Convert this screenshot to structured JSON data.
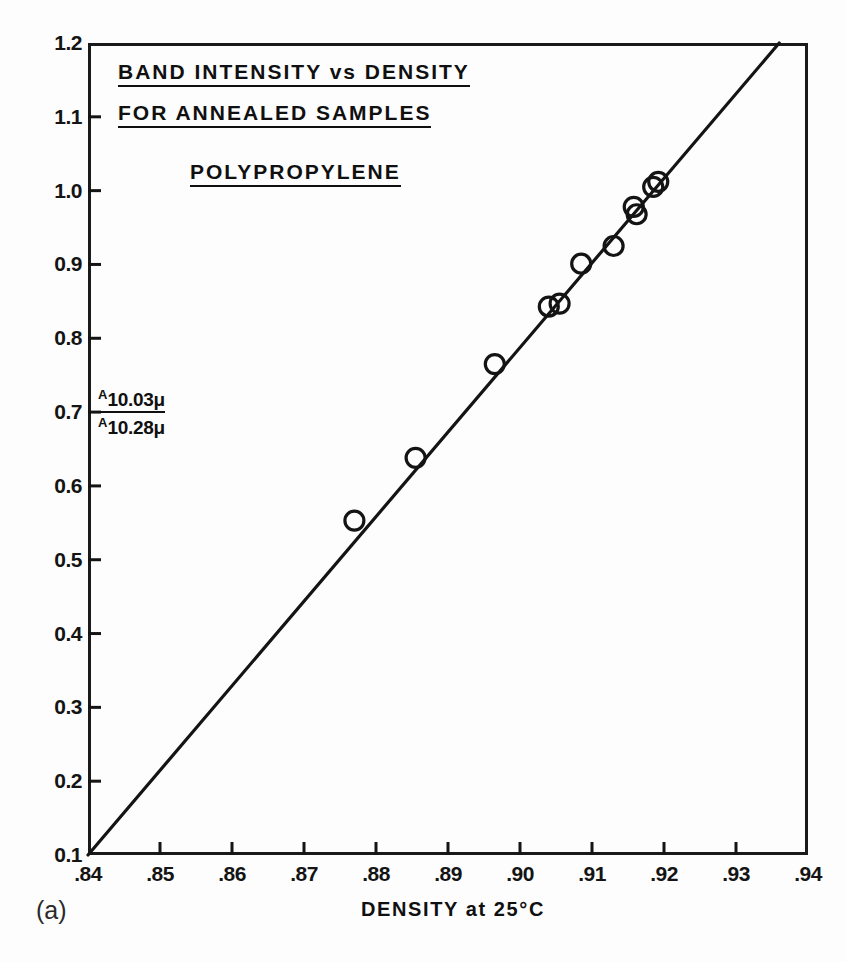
{
  "figure": {
    "panel_label": "(a)",
    "title_lines": [
      "BAND INTENSITY vs DENSITY",
      "FOR ANNEALED SAMPLES"
    ],
    "subtitle": "POLYPROPYLENE",
    "ylabel_numerator_symbol": "A",
    "ylabel_numerator_value": "10.03μ",
    "ylabel_denominator_symbol": "A",
    "ylabel_denominator_value": "10.28μ",
    "xaxis_title": "DENSITY  at  25°C",
    "marker_style": "open-circle",
    "line_color": "#141414",
    "marker_color": "#141414",
    "background_color": "#fdfdfd"
  },
  "chart_data": {
    "type": "scatter",
    "xlabel": "DENSITY at 25°C",
    "ylabel": "A 10.03μ / A 10.28μ",
    "xlim": [
      0.84,
      0.94
    ],
    "ylim": [
      0.1,
      1.2
    ],
    "xticks": [
      0.84,
      0.85,
      0.86,
      0.87,
      0.88,
      0.89,
      0.9,
      0.91,
      0.92,
      0.93,
      0.94
    ],
    "xtick_labels": [
      ".84",
      ".85",
      ".86",
      ".87",
      ".88",
      ".89",
      ".90",
      ".91",
      ".92",
      ".93",
      ".94"
    ],
    "yticks": [
      0.1,
      0.2,
      0.3,
      0.4,
      0.5,
      0.6,
      0.7,
      0.8,
      0.9,
      1.0,
      1.1,
      1.2
    ],
    "ytick_labels": [
      "0.1",
      "0.2",
      "0.3",
      "0.4",
      "0.5",
      "0.6",
      "0.7",
      "0.8",
      "0.9",
      "1.0",
      "1.1",
      "1.2"
    ],
    "grid": false,
    "legend": false,
    "series": [
      {
        "name": "annealed polypropylene samples",
        "marker": "open-circle",
        "points": [
          {
            "x": 0.877,
            "y": 0.553
          },
          {
            "x": 0.8855,
            "y": 0.638
          },
          {
            "x": 0.8965,
            "y": 0.765
          },
          {
            "x": 0.904,
            "y": 0.843
          },
          {
            "x": 0.9055,
            "y": 0.847
          },
          {
            "x": 0.9085,
            "y": 0.901
          },
          {
            "x": 0.913,
            "y": 0.925
          },
          {
            "x": 0.9158,
            "y": 0.978
          },
          {
            "x": 0.9162,
            "y": 0.968
          },
          {
            "x": 0.9185,
            "y": 1.005
          },
          {
            "x": 0.9192,
            "y": 1.012
          }
        ]
      }
    ],
    "fit_line": {
      "name": "least-squares line",
      "x_start": 0.84,
      "y_start": 0.1,
      "x_end": 0.936,
      "y_end": 1.2
    }
  }
}
